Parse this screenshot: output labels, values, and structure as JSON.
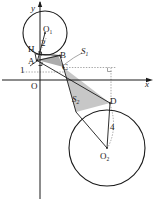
{
  "figure": {
    "background_color": "#ffffff",
    "stroke_color": "#1a1a1a",
    "shade_color": "#b9b9b9",
    "dotted_color": "#8a8a8a"
  },
  "axes": {
    "x_label": "x",
    "y_label": "y",
    "origin_label": "O"
  },
  "points": [
    {
      "id": "H",
      "label": "H",
      "x": 33,
      "y": 50
    },
    {
      "id": "A",
      "label": "A",
      "x": 33,
      "y": 61
    },
    {
      "id": "B",
      "label": "B",
      "x": 62,
      "y": 56
    },
    {
      "id": "C",
      "label": "C",
      "x": 63,
      "y": 67
    },
    {
      "id": "D",
      "label": "D",
      "x": 110,
      "y": 103
    },
    {
      "id": "O1",
      "label": "O",
      "sub": "1",
      "x": 45,
      "y": 33
    },
    {
      "id": "O2",
      "label": "O",
      "sub": "2",
      "x": 107,
      "y": 148
    }
  ],
  "circles": [
    {
      "id": "circle-1",
      "center_label": "O",
      "center_sub": "1",
      "cx": 45,
      "cy": 33,
      "r": 22,
      "radius_label": "2"
    },
    {
      "id": "circle-2",
      "center_label": "O",
      "center_sub": "2",
      "cx": 107,
      "cy": 148,
      "r": 38,
      "radius_label": "4"
    }
  ],
  "measures": [
    {
      "id": "radius-1",
      "label": "2"
    },
    {
      "id": "radius-2",
      "label": "4"
    },
    {
      "id": "segment-1",
      "label": "1"
    }
  ],
  "regions": [
    {
      "id": "region-s1",
      "label": "S",
      "sub": "1"
    },
    {
      "id": "region-s2",
      "label": "S",
      "sub": "2"
    }
  ]
}
